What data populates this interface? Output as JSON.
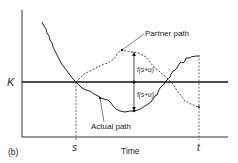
{
  "figure": {
    "panel_label": "(b)",
    "y_axis_label": "K",
    "x_axis_label": "Time",
    "ticks": {
      "s": "s",
      "t": "t"
    },
    "annotations": {
      "partner_path": "Partner path",
      "actual_path": "Actual path",
      "upper_distance": "f(s+u)",
      "lower_distance": "f(s+u)"
    },
    "colors": {
      "line": "#222222",
      "background": "#ffffff"
    }
  }
}
